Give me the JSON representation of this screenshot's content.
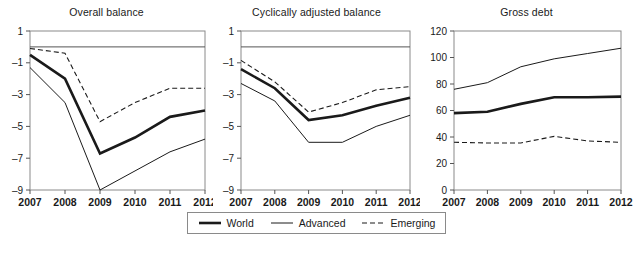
{
  "figure": {
    "background": "#ffffff",
    "line_color": "#1a1a1a"
  },
  "legend": {
    "entries": [
      {
        "label": "World",
        "style": "thick-solid",
        "width": 2.6,
        "dash": "none"
      },
      {
        "label": "Advanced",
        "style": "thin-solid",
        "width": 1.0,
        "dash": "none"
      },
      {
        "label": "Emerging",
        "style": "dashed",
        "width": 1.1,
        "dash": "5,3"
      }
    ]
  },
  "chart_data": [
    {
      "type": "line",
      "title": "Overall balance",
      "xlabel": "",
      "ylabel": "",
      "x": [
        "2007",
        "2008",
        "2009",
        "2010",
        "2011",
        "2012"
      ],
      "xlim": [
        2007,
        2012
      ],
      "ylim": [
        -9,
        1
      ],
      "yticks": [
        1,
        -1,
        -3,
        -5,
        -7,
        -9
      ],
      "ytick_labels": [
        "1",
        "–1",
        "–3",
        "–5",
        "–7",
        "–9"
      ],
      "grid": false,
      "zero_line": true,
      "legend_position": "below-figure",
      "series": [
        {
          "name": "World",
          "values": [
            -0.5,
            -2.0,
            -6.7,
            -5.7,
            -4.4,
            -4.0
          ]
        },
        {
          "name": "Advanced",
          "values": [
            -1.3,
            -3.5,
            -9.0,
            -7.8,
            -6.6,
            -5.8
          ]
        },
        {
          "name": "Emerging",
          "values": [
            -0.1,
            -0.4,
            -4.7,
            -3.5,
            -2.6,
            -2.6
          ]
        }
      ]
    },
    {
      "type": "line",
      "title": "Cyclically adjusted balance",
      "xlabel": "",
      "ylabel": "",
      "x": [
        "2007",
        "2008",
        "2009",
        "2010",
        "2011",
        "2012"
      ],
      "xlim": [
        2007,
        2012
      ],
      "ylim": [
        -9,
        1
      ],
      "yticks": [
        1,
        -1,
        -3,
        -5,
        -7,
        -9
      ],
      "ytick_labels": [
        "1",
        "–1",
        "–3",
        "–5",
        "–7",
        "–9"
      ],
      "grid": false,
      "zero_line": true,
      "legend_position": "below-figure",
      "series": [
        {
          "name": "World",
          "values": [
            -1.4,
            -2.6,
            -4.6,
            -4.3,
            -3.7,
            -3.2
          ]
        },
        {
          "name": "Advanced",
          "values": [
            -2.3,
            -3.4,
            -6.0,
            -6.0,
            -5.0,
            -4.3
          ]
        },
        {
          "name": "Emerging",
          "values": [
            -0.85,
            -2.2,
            -4.1,
            -3.5,
            -2.7,
            -2.5
          ]
        }
      ]
    },
    {
      "type": "line",
      "title": "Gross debt",
      "xlabel": "",
      "ylabel": "",
      "x": [
        "2007",
        "2008",
        "2009",
        "2010",
        "2011",
        "2012"
      ],
      "xlim": [
        2007,
        2012
      ],
      "ylim": [
        0,
        120
      ],
      "yticks": [
        120,
        100,
        80,
        60,
        40,
        20,
        0
      ],
      "ytick_labels": [
        "120",
        "100",
        "80",
        "60",
        "40",
        "20",
        "0"
      ],
      "grid": false,
      "zero_line": false,
      "legend_position": "below-figure",
      "series": [
        {
          "name": "World",
          "values": [
            58,
            59,
            65,
            70,
            70,
            70.5
          ]
        },
        {
          "name": "Advanced",
          "values": [
            76,
            81,
            93,
            99,
            103,
            107
          ]
        },
        {
          "name": "Emerging",
          "values": [
            36,
            35.5,
            35.5,
            40.5,
            37,
            36
          ]
        }
      ]
    }
  ]
}
